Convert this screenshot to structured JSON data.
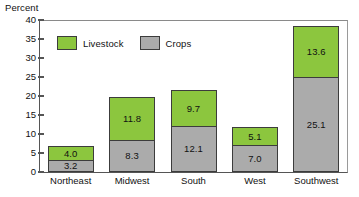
{
  "chart_data": {
    "type": "bar",
    "subtype": "stacked-vertical",
    "title": "",
    "xlabel": "",
    "ylabel": "Percent",
    "ylim": [
      0,
      40
    ],
    "y_ticks": [
      0,
      5,
      10,
      15,
      20,
      25,
      30,
      35,
      40
    ],
    "y_tick_labels": [
      "0",
      "5",
      "10",
      "15",
      "20",
      "25",
      "30",
      "35",
      "40"
    ],
    "grid": false,
    "legend_position": "inside-top-left",
    "categories": [
      "Northeast",
      "Midwest",
      "South",
      "West",
      "Southwest"
    ],
    "series": [
      {
        "name": "Crops",
        "color": "#ababab",
        "stack_order": 0,
        "values": [
          3.2,
          8.3,
          12.1,
          7.0,
          25.1
        ],
        "value_labels": [
          "3.2",
          "8.3",
          "12.1",
          "7.0",
          "25.1"
        ]
      },
      {
        "name": "Livestock",
        "color": "#8cc63e",
        "stack_order": 1,
        "values": [
          4.0,
          11.8,
          9.7,
          5.1,
          13.6
        ],
        "value_labels": [
          "4.0",
          "11.8",
          "9.7",
          "5.1",
          "13.6"
        ]
      }
    ],
    "totals": [
      7.2,
      20.1,
      21.8,
      12.1,
      38.7
    ]
  },
  "axis": {
    "y_title": "Percent"
  },
  "legend": {
    "items": [
      {
        "label": "Livestock",
        "color": "#8cc63e",
        "swatch_name": "legend-swatch-livestock"
      },
      {
        "label": "Crops",
        "color": "#ababab",
        "swatch_name": "legend-swatch-crops"
      }
    ]
  },
  "colors": {
    "livestock": "#8cc63e",
    "crops": "#ababab",
    "bar_outline": "#3c3c3c",
    "axis": "#555555",
    "text": "#111111",
    "background": "#ffffff"
  }
}
